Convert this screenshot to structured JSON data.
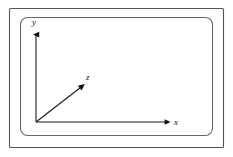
{
  "figure": {
    "background_color": "#ffffff",
    "line_color": "#3a3a3a",
    "axis_color": "#1a1a1a",
    "label_color": "#111111",
    "width": 233,
    "height": 157
  },
  "outer_frame": {
    "name": "outer-border-rectangle",
    "x": 9,
    "y": 8,
    "width": 215,
    "height": 140,
    "stroke": "#555555",
    "stroke_width": 1.1,
    "corner_radius": 1
  },
  "inner_frame": {
    "name": "inner-rounded-rectangle",
    "x": 20,
    "y": 17,
    "width": 193,
    "height": 119,
    "stroke": "#666666",
    "stroke_width": 1.1,
    "corner_radius": 7
  },
  "origin": {
    "label": "O",
    "x": 36,
    "y": 122,
    "visible_label": false
  },
  "axes": [
    {
      "id": "y-axis",
      "label": "y",
      "label_x": 35,
      "label_y": 25,
      "from_x": 36,
      "from_y": 122,
      "to_x": 36,
      "to_y": 31,
      "arrow": "triangle",
      "direction": "up"
    },
    {
      "id": "z-axis",
      "label": "z",
      "label_x": 89,
      "label_y": 80,
      "from_x": 36,
      "from_y": 122,
      "to_x": 85,
      "to_y": 84,
      "arrow": "triangle",
      "direction": "up-right-diagonal"
    },
    {
      "id": "x-axis",
      "label": "x",
      "label_x": 177,
      "label_y": 125,
      "from_x": 36,
      "from_y": 122,
      "to_x": 171,
      "to_y": 122,
      "arrow": "triangle",
      "direction": "right"
    }
  ]
}
